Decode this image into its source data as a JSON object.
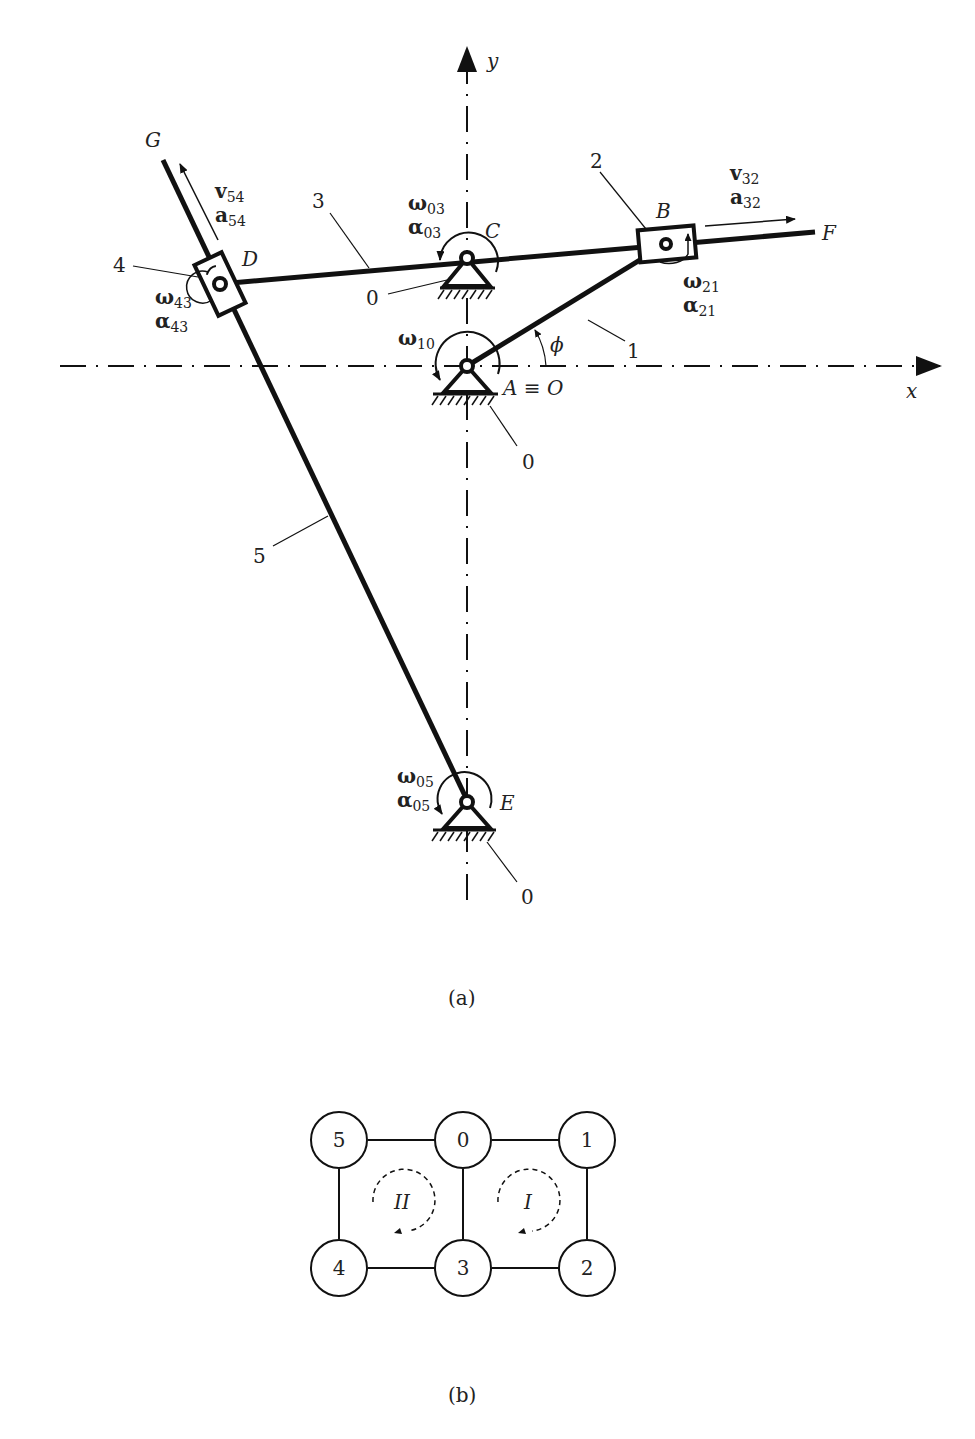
{
  "figure_a": {
    "caption": "(a)",
    "axes": {
      "x_label": "x",
      "y_label": "y"
    },
    "points": {
      "G": "G",
      "D": "D",
      "C": "C",
      "B": "B",
      "F": "F",
      "A": "A ≡ O",
      "E": "E"
    },
    "links": {
      "l1": "1",
      "l2": "2",
      "l3": "3",
      "l4": "4",
      "l5": "5",
      "ground_c": "0",
      "ground_a": "0",
      "ground_e": "0"
    },
    "angle": "ϕ",
    "vectors": {
      "v54": {
        "sym": "v",
        "sub": "54"
      },
      "a54": {
        "sym": "a",
        "sub": "54"
      },
      "v32": {
        "sym": "v",
        "sub": "32"
      },
      "a32": {
        "sym": "a",
        "sub": "32"
      },
      "w03": {
        "sym": "ω",
        "sub": "03"
      },
      "al03": {
        "sym": "α",
        "sub": "03"
      },
      "w21": {
        "sym": "ω",
        "sub": "21"
      },
      "al21": {
        "sym": "α",
        "sub": "21"
      },
      "w43": {
        "sym": "ω",
        "sub": "43"
      },
      "al43": {
        "sym": "α",
        "sub": "43"
      },
      "w10": {
        "sym": "ω",
        "sub": "10"
      },
      "w05": {
        "sym": "ω",
        "sub": "05"
      },
      "al05": {
        "sym": "α",
        "sub": "05"
      }
    }
  },
  "figure_b": {
    "caption": "(b)",
    "nodes": [
      "5",
      "0",
      "1",
      "4",
      "3",
      "2"
    ],
    "loops": [
      "II",
      "I"
    ]
  }
}
